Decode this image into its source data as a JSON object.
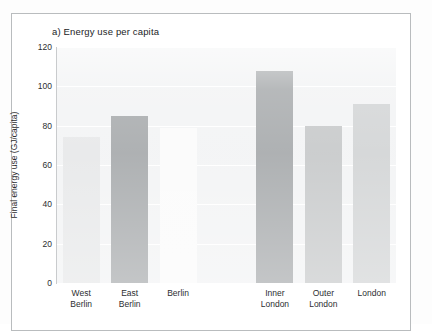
{
  "figure": {
    "panel_label": "a)",
    "title": "a) Energy use per capita"
  },
  "chart_data": {
    "type": "bar",
    "title": "a) Energy use per capita",
    "xlabel": "",
    "ylabel": "Final energy use (GJ/capita)",
    "ylim": [
      0,
      120
    ],
    "ytick_labels": [
      "0",
      "20",
      "40",
      "60",
      "80",
      "100",
      "120"
    ],
    "ytick_values": [
      0,
      20,
      40,
      60,
      80,
      100,
      120
    ],
    "grid": "horizontal",
    "legend": "none",
    "categories": [
      "West\nBerlin",
      "East\nBerlin",
      "Berlin",
      "",
      "Inner\nLondon",
      "Outer\nLondon",
      "London"
    ],
    "values": [
      74,
      85,
      79,
      null,
      108,
      80,
      91
    ],
    "bar_colors": [
      "#e8e9ea",
      "#aaadaf",
      "#fbfbfb",
      "none",
      "#aaadaf",
      "#c9cbcc",
      "#d4d6d7"
    ],
    "bars": [
      {
        "label": "West\nBerlin",
        "value": 74,
        "color": "#e8e9ea"
      },
      {
        "label": "East\nBerlin",
        "value": 85,
        "color": "#aaadaf"
      },
      {
        "label": "Berlin",
        "value": 79,
        "color": "#fbfbfb"
      },
      {
        "label": "",
        "value": null,
        "color": "none"
      },
      {
        "label": "Inner\nLondon",
        "value": 108,
        "color": "#aaadaf"
      },
      {
        "label": "Outer\nLondon",
        "value": 80,
        "color": "#c9cbcc"
      },
      {
        "label": "London",
        "value": 91,
        "color": "#d4d6d7"
      }
    ]
  },
  "axes": {
    "y_title": "Final energy use (GJ/capita)",
    "y_ticks": [
      "120",
      "100",
      "80",
      "60",
      "40",
      "20",
      "0"
    ]
  },
  "x_labels": [
    "West\nBerlin",
    "East\nBerlin",
    "Berlin",
    "Inner\nLondon",
    "Outer\nLondon",
    "London"
  ],
  "colors": {
    "plot_background": "#f3f4f5",
    "gridline": "#ffffff",
    "axis": "#c9cbcd",
    "frame": "#b9bcbe",
    "text": "#2c2e30"
  }
}
